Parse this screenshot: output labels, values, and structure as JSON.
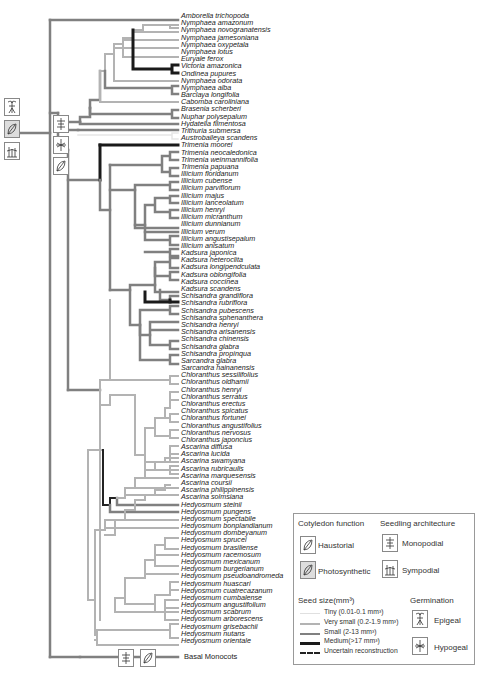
{
  "figure": {
    "type": "phylogenetic-tree"
  },
  "taxa": [
    "Amborella trichopoda",
    "Nymphaea amazonum",
    "Nymphaea novogranatensis",
    "Nymphaea jamesoniana",
    "Nymphaea oxypetala",
    "Nymphaea lotus",
    "Euryale ferox",
    "Victoria amazonica",
    "Ondinea pupures",
    "Nymphaea odorata",
    "Nymphaea alba",
    "Barclaya longifolia",
    "Cabomba caroliniana",
    "Brasenia scherberi",
    "Nuphar polysepalum",
    "Hydatella filmentosa",
    "Trithuria submersa",
    "Austrobaileya scandens",
    "Trimenia moorei",
    "Trimenia neocaledonica",
    "Trimenia weinmannifolia",
    "Trimenia papuana",
    "Illicium floridanum",
    "Illicium cubense",
    "Illicium parviflorum",
    "Illicium majus",
    "Illicium lanceolatum",
    "Illicium henryi",
    "Illicium micranthum",
    "Illicium dunnianum",
    "Illicium verum",
    "Illicium angustisepalum",
    "Illicium anisatum",
    "Kadsura japonica",
    "Kadsura heteroclita",
    "Kadsura longipendculata",
    "Kadsura oblongifolia",
    "Kadsura coccinea",
    "Kadsura scandens",
    "Schisandra grandiflora",
    "Schisandra rubriflora",
    "Schisandra pubescens",
    "Schisandra sphenanthera",
    "Schisandra henryi",
    "Schisandra arisanensis",
    "Schisandra chinensis",
    "Schisandra glabra",
    "Schisandra propinqua",
    "Sarcandra glabra",
    "Sarcandra hainanensis",
    "Chloranthus sessilifolius",
    "Chloranthus oldhamii",
    "Chloranthus henryi",
    "Chloranthus serratus",
    "Chloranthus erectus",
    "Chloranthus spicatus",
    "Chloranthus fortunei",
    "Chloranthus angustifolius",
    "Chloranthus nervosus",
    "Chloranthus japoncius",
    "Ascarina diffusa",
    "Ascarina lucida",
    "Ascarina swamyana",
    "Ascarina rubricaulis",
    "Ascarina marquesensis",
    "Ascarina coursii",
    "Ascarina philippinensis",
    "Ascarina solmsiana",
    "Hedyosmum steinii",
    "Hedyosmum pungens",
    "Hedyosmum spectabile",
    "Hedyosmum bonplandianum",
    "Hedyosmum dombeyanum",
    "Hedyosmum sprucei",
    "Hedyosmum brasiliense",
    "Hedyosmum racemosum",
    "Hedyosmum mexicanum",
    "Hedyosmum burgerianum",
    "Hedyosmum pseudoandromeda",
    "Hedyosmum huascari",
    "Hedyosmum cuatrecazanum",
    "Hedyosmum cumbalense",
    "Hedyosmum angustifolium",
    "Hedyosmum scabrum",
    "Hedyosmum arborescens",
    "Hedyosmum grisebachii",
    "Hedyosmum nutans",
    "Hedyosmum orientale"
  ],
  "outgroup": "Basal Monocots",
  "legend": {
    "cotyledon_title": "Cotyledon function",
    "haustorial": "Haustorial",
    "photosynthetic": "Photosynthetic",
    "architecture_title": "Seedling architecture",
    "monopodial": "Monopodial",
    "sympodial": "Sympodial",
    "seed_title": "Seed size(mm³)",
    "seed_sizes": [
      {
        "label": "Tiny (0.01-0.1 mm³)",
        "color": "#e6e6e6",
        "width": 1
      },
      {
        "label": "Very small (0.2-1.9 mm³)",
        "color": "#b3b3b3",
        "width": 2
      },
      {
        "label": "Small (2-13 mm³)",
        "color": "#808080",
        "width": 2.5
      },
      {
        "label": "Medium(>17 mm³)",
        "color": "#1a1a1a",
        "width": 3
      },
      {
        "label": "Uncertain reconstruction",
        "color": "#222222",
        "width": 2,
        "dashed": true
      }
    ],
    "germination_title": "Germination",
    "epigeal": "Epigeal",
    "hypogeal": "Hypogeal"
  },
  "colors": {
    "tiny": "#e6e6e6",
    "very_small": "#b3b3b3",
    "small": "#808080",
    "medium": "#1a1a1a"
  }
}
